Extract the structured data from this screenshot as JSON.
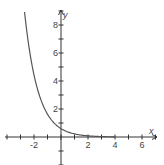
{
  "chart_data": {
    "type": "line",
    "title": "",
    "xlabel": "x",
    "ylabel": "y",
    "xlim": [
      -4.3,
      7.3
    ],
    "ylim": [
      -3.6,
      9.3
    ],
    "grid": false,
    "x_ticks": [
      -4,
      -3,
      -2,
      -1,
      0,
      1,
      2,
      3,
      4,
      5,
      6,
      7
    ],
    "x_tick_labels": [
      {
        "value": -2,
        "label": "-2"
      },
      {
        "value": 2,
        "label": "2"
      },
      {
        "value": 4,
        "label": "4"
      },
      {
        "value": 6,
        "label": "6"
      }
    ],
    "y_ticks": [
      -2,
      -1,
      1,
      2,
      3,
      4,
      5,
      6,
      7,
      8,
      9
    ],
    "y_tick_labels": [
      {
        "value": 2,
        "label": "2"
      },
      {
        "value": 4,
        "label": "4"
      },
      {
        "value": 6,
        "label": "6"
      },
      {
        "value": 8,
        "label": "8"
      }
    ],
    "series": [
      {
        "name": "exponential decay",
        "x": [
          -2.7,
          -2.5,
          -2,
          -1.5,
          -1,
          -0.5,
          0,
          0.5,
          1,
          1.5,
          2,
          2.5,
          3,
          3.5,
          4
        ],
        "y": [
          8.94,
          7.31,
          4.43,
          2.69,
          1.63,
          0.99,
          0.6,
          0.36,
          0.22,
          0.13,
          0.08,
          0.05,
          0.03,
          0.02,
          0.01
        ]
      }
    ],
    "colors": {
      "curve": "#555555",
      "axes": "#333333",
      "labels": "#444444"
    }
  }
}
